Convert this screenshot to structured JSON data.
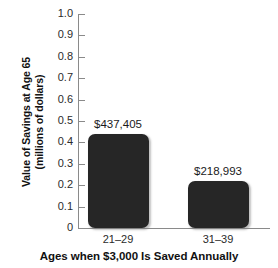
{
  "chart_data": {
    "type": "bar",
    "title": "",
    "subtitle": "",
    "xlabel": "Ages when $3,000 Is Saved Annually",
    "ylabel": "Value of Savings at Age 65 (millions of dollars)",
    "ylabel_line1": "Value of Savings at Age 65",
    "ylabel_line2": "(millions of dollars)",
    "categories": [
      "21–29",
      "31–39"
    ],
    "values": [
      0.437405,
      0.218993
    ],
    "data_labels": [
      "$437,405",
      "$218,993"
    ],
    "ylim": [
      0,
      1.0
    ],
    "ytick_labels": [
      "1.0",
      "0.9",
      "0.8",
      "0.7",
      "0.6",
      "0.5",
      "0.4",
      "0.3",
      "0.2",
      "0.1",
      "0"
    ],
    "ytick_values": [
      1.0,
      0.9,
      0.8,
      0.7,
      0.6,
      0.5,
      0.4,
      0.3,
      0.2,
      0.1,
      0.0
    ],
    "grid": false,
    "legend": false,
    "bar_color": "#262626",
    "axis_color": "#8a8a8a",
    "background_color": "#ffffff"
  }
}
